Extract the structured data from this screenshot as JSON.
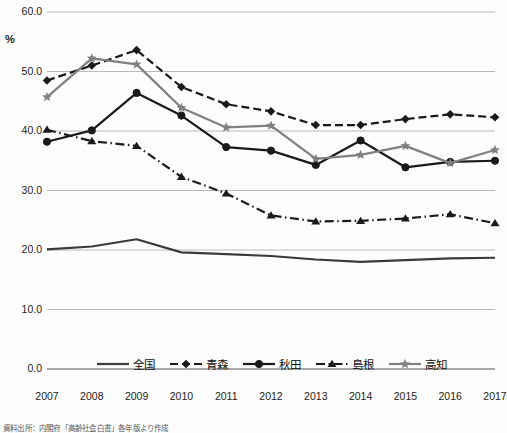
{
  "chart_data": {
    "type": "line",
    "title": "",
    "xlabel": "",
    "ylabel": "%",
    "unit_label": "%",
    "categories": [
      "2007",
      "2008",
      "2009",
      "2010",
      "2011",
      "2012",
      "2013",
      "2014",
      "2015",
      "2016",
      "2017"
    ],
    "ylim": [
      0.0,
      60.0
    ],
    "ytick_step": 10.0,
    "ytick_labels": [
      "60.0",
      "50.0",
      "40.0",
      "30.0",
      "20.0",
      "10.0",
      "0.0"
    ],
    "ytick_values": [
      60.0,
      50.0,
      40.0,
      30.0,
      20.0,
      10.0,
      0.0
    ],
    "grid": true,
    "grid_axis": "y",
    "legend_position": "bottom",
    "series": [
      {
        "name": "全国",
        "color": "#3a3a3a",
        "style": "solid",
        "marker": "none",
        "values": [
          20.1,
          20.6,
          21.8,
          19.6,
          19.3,
          19.0,
          18.4,
          18.0,
          18.3,
          18.6,
          18.7
        ]
      },
      {
        "name": "青森",
        "color": "#1a1a1a",
        "style": "dashed",
        "marker": "diamond",
        "values": [
          48.5,
          51.0,
          53.6,
          47.4,
          44.5,
          43.3,
          41.0,
          41.0,
          42.0,
          42.8,
          42.3
        ]
      },
      {
        "name": "秋田",
        "color": "#1a1a1a",
        "style": "solid",
        "marker": "circle",
        "values": [
          38.2,
          40.1,
          46.4,
          42.6,
          37.3,
          36.7,
          34.3,
          38.4,
          33.9,
          34.8,
          35.0
        ]
      },
      {
        "name": "島根",
        "color": "#1a1a1a",
        "style": "dashdot",
        "marker": "triangle",
        "values": [
          40.2,
          38.3,
          37.5,
          32.3,
          29.5,
          25.8,
          24.8,
          24.9,
          25.3,
          26.0,
          24.5
        ]
      },
      {
        "name": "高知",
        "color": "#808080",
        "style": "solid",
        "marker": "star",
        "values": [
          45.7,
          52.2,
          51.2,
          43.9,
          40.6,
          40.9,
          35.3,
          36.0,
          37.5,
          34.6,
          36.8
        ]
      }
    ]
  },
  "footer": {
    "note": "資料出所：内閣府「高齢社会白書」各年版より作成"
  }
}
